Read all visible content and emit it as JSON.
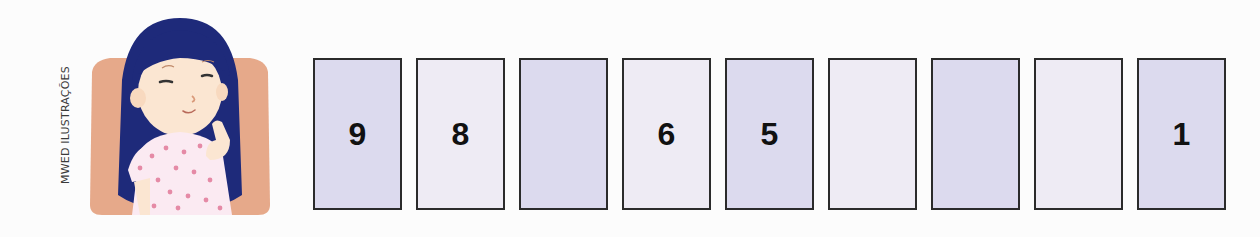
{
  "credit": "MWED ILUSTRAÇÕES",
  "illustration": {
    "subject": "girl-thinking",
    "colors": {
      "background_panel": "#e6a98a",
      "hair": "#1e2a7a",
      "skin": "#fbe6d2",
      "dress": "#fbeaf2",
      "dots": "#e58aa6"
    }
  },
  "sequence": {
    "cards": [
      {
        "value": "9",
        "shade": "dark"
      },
      {
        "value": "8",
        "shade": "light"
      },
      {
        "value": "",
        "shade": "dark"
      },
      {
        "value": "6",
        "shade": "light"
      },
      {
        "value": "5",
        "shade": "dark"
      },
      {
        "value": "",
        "shade": "light"
      },
      {
        "value": "",
        "shade": "dark"
      },
      {
        "value": "",
        "shade": "light"
      },
      {
        "value": "1",
        "shade": "dark"
      }
    ],
    "colors": {
      "dark": "#dcdaee",
      "light": "#eeebf4",
      "border": "#2b2b2b"
    }
  }
}
